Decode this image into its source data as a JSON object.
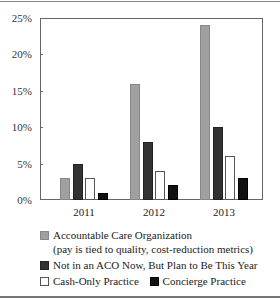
{
  "chart_data": {
    "type": "bar",
    "title": "",
    "xlabel": "",
    "ylabel": "",
    "categories": [
      "2011",
      "2012",
      "2013"
    ],
    "series": [
      {
        "name": "Accountable Care Organization (pay is tied to quality, cost-reduction metrics)",
        "values": [
          3,
          16,
          24
        ],
        "color": "#a0a0a0"
      },
      {
        "name": "Not in an ACO Now, But Plan to Be This Year",
        "values": [
          5,
          8,
          10
        ],
        "color": "#333333"
      },
      {
        "name": "Cash-Only Practice",
        "values": [
          3,
          4,
          6
        ],
        "color": "#ffffff"
      },
      {
        "name": "Concierge Practice",
        "values": [
          1,
          2,
          3
        ],
        "color": "#111111"
      }
    ],
    "ylim": [
      0,
      25
    ],
    "yticks": [
      "0%",
      "5%",
      "10%",
      "15%",
      "20%",
      "25%"
    ],
    "grid": false,
    "legend_position": "bottom"
  },
  "legend": {
    "aco_line1": "Accountable Care Organization",
    "aco_line2": "(pay is tied to quality, cost-reduction metrics)",
    "plan": "Not in an ACO Now, But Plan to Be This Year",
    "cash": "Cash-Only Practice",
    "concierge": "Concierge Practice"
  }
}
